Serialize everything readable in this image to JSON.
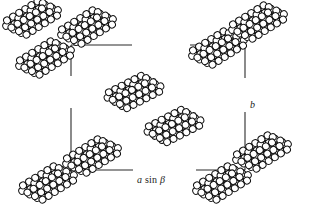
{
  "figure": {
    "kind": "crystal-packing-diagram",
    "compound": "anthracene",
    "background_color": "#ffffff",
    "ink_color": "#111111",
    "atom_fill_color": "#ffffff",
    "width": 310,
    "height": 221
  },
  "unit_cell": {
    "label": "unit-cell-outline",
    "stroke_color": "#2b2b2b",
    "stroke_width": 1.1,
    "left": 71,
    "top": 45,
    "right": 245,
    "bottom": 170,
    "corner_gaps": [
      {
        "edge": "top",
        "gap_start": 132,
        "gap_end": 190
      },
      {
        "edge": "bottom",
        "gap_start": 133,
        "gap_end": 196
      },
      {
        "edge": "left",
        "gap_start": 76,
        "gap_end": 108
      },
      {
        "edge": "right",
        "gap_start": 78,
        "gap_end": 112
      }
    ]
  },
  "axes": {
    "horizontal": {
      "name": "a-axis-label",
      "text_a": "a",
      "text_sin": "sin",
      "text_beta": "β",
      "full_text": "a sin β",
      "x": 137,
      "y": 174
    },
    "vertical": {
      "name": "b-axis-label",
      "text": "b",
      "x": 250,
      "y": 99
    }
  },
  "molecule_style": {
    "bond_color": "#111111",
    "bond_width": 3.2,
    "atom_radius": 3.4,
    "atom_stroke": "#111111",
    "atom_stroke_width": 1.0,
    "atom_fill": "#ffffff",
    "rings": 3,
    "ring_atoms": 6,
    "layers": 3,
    "layer_offset_x": 4.5,
    "layer_offset_y": 7.0
  },
  "molecules": [
    {
      "id": "mol-top-left-outside",
      "name": "molecule-top-left-outside",
      "cx": 32,
      "cy": 18,
      "rotation": -32,
      "scale": 1.0
    },
    {
      "id": "mol-top-edge",
      "name": "molecule-top-edge",
      "cx": 87,
      "cy": 27,
      "rotation": -32,
      "scale": 1.0
    },
    {
      "id": "mol-left-edge-upper",
      "name": "molecule-left-edge-upper",
      "cx": 45,
      "cy": 58,
      "rotation": -32,
      "scale": 1.0
    },
    {
      "id": "mol-cell-corner-topright",
      "name": "molecule-cell-corner-topright",
      "cx": 218,
      "cy": 48,
      "rotation": -32,
      "scale": 1.0
    },
    {
      "id": "mol-top-right-outside",
      "name": "molecule-top-right-outside",
      "cx": 258,
      "cy": 22,
      "rotation": -32,
      "scale": 1.0
    },
    {
      "id": "mol-center-upper",
      "name": "molecule-center-upper",
      "cx": 134,
      "cy": 92,
      "rotation": -27,
      "scale": 1.0
    },
    {
      "id": "mol-center-lower",
      "name": "molecule-center-lower",
      "cx": 174,
      "cy": 126,
      "rotation": -27,
      "scale": 1.0
    },
    {
      "id": "mol-cell-corner-botleft",
      "name": "molecule-cell-corner-botleft",
      "cx": 92,
      "cy": 156,
      "rotation": -32,
      "scale": 1.0
    },
    {
      "id": "mol-bottom-left-outside",
      "name": "molecule-bottom-left-outside",
      "cx": 48,
      "cy": 183,
      "rotation": -32,
      "scale": 1.0
    },
    {
      "id": "mol-cell-corner-botright",
      "name": "molecule-cell-corner-botright",
      "cx": 262,
      "cy": 152,
      "rotation": -32,
      "scale": 1.0
    },
    {
      "id": "mol-bottom-right-edge",
      "name": "molecule-bottom-right-edge",
      "cx": 222,
      "cy": 183,
      "rotation": -32,
      "scale": 1.0
    }
  ]
}
